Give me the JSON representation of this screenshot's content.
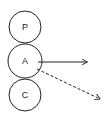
{
  "diagram": {
    "nodes": [
      {
        "id": "P",
        "label": "P",
        "cx": 25,
        "cy": 27,
        "r": 16
      },
      {
        "id": "A",
        "label": "A",
        "cx": 25,
        "cy": 61,
        "r": 17
      },
      {
        "id": "C",
        "label": "C",
        "cx": 25,
        "cy": 95,
        "r": 16
      }
    ],
    "edges": [
      {
        "from": "A",
        "style": "solid",
        "x1": 38,
        "y1": 62,
        "x2": 87,
        "y2": 62
      },
      {
        "from": "A",
        "style": "dashed",
        "x1": 37,
        "y1": 69,
        "x2": 100,
        "y2": 99
      }
    ],
    "colors": {
      "stroke": "#222222",
      "background": "#ffffff"
    }
  }
}
